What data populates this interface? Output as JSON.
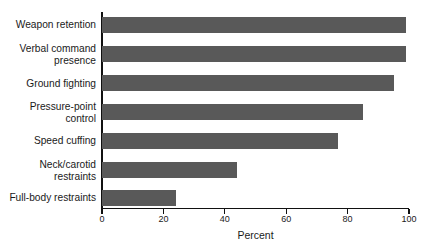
{
  "chart_data": {
    "type": "bar",
    "orientation": "horizontal",
    "title": "",
    "subtitle": "",
    "xlabel": "Percent",
    "ylabel": "",
    "categories": [
      "Weapon retention",
      "Verbal command\npresence",
      "Ground fighting",
      "Pressure-point\ncontrol",
      "Speed cuffing",
      "Neck/carotid\nrestraints",
      "Full-body restraints"
    ],
    "values": [
      99,
      99,
      95,
      85,
      77,
      44,
      24
    ],
    "xlim": [
      0,
      100
    ],
    "xticks": [
      0,
      20,
      40,
      60,
      80,
      100
    ],
    "xtick_labels": [
      "0",
      "20",
      "40",
      "60",
      "80",
      "100"
    ],
    "grid": false,
    "legend": false,
    "bar_color": "#595959",
    "axis_color": "#111111",
    "background_color": "#ffffff"
  }
}
